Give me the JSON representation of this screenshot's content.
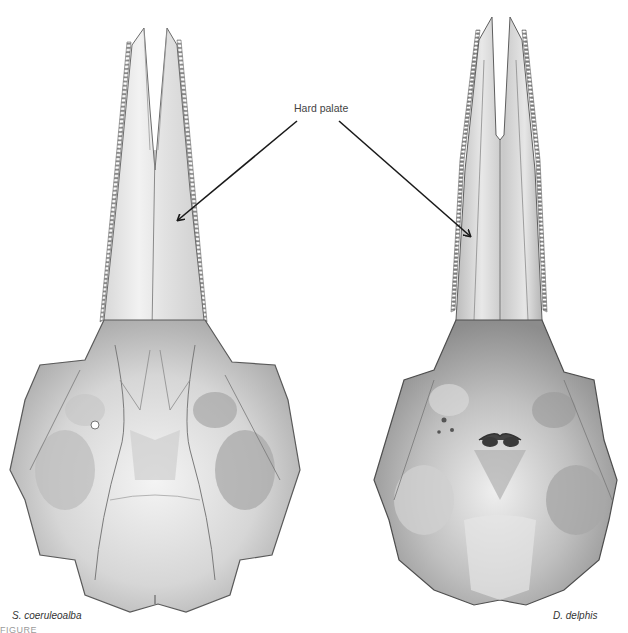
{
  "figure": {
    "annotation": {
      "label": "Hard palate",
      "arrow_count": 2,
      "color": "#1a1a1a"
    },
    "specimens": [
      {
        "name": "S. coeruleoalba",
        "side": "left",
        "view": "ventral skull"
      },
      {
        "name": "D. delphis",
        "side": "right",
        "view": "ventral skull"
      }
    ],
    "caption_fragment": "FIGURE",
    "colors": {
      "background": "#ffffff",
      "bone_light": "#eeeeee",
      "bone_mid": "#c8c8c8",
      "bone_dark": "#7a7a7a",
      "outline": "#5a5a5a"
    }
  }
}
